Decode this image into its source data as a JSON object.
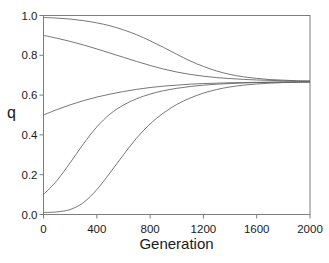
{
  "figure": {
    "background": "#ffffff",
    "frame_color": "#7d7d7d",
    "curve_color": "#5f5f5f",
    "text_color": "#1a1a1a"
  },
  "chart_data": {
    "type": "line",
    "title": "",
    "xlabel": "Generation",
    "ylabel": "q",
    "xlim": [
      0,
      2000
    ],
    "ylim": [
      0.0,
      1.0
    ],
    "x_ticks": [
      0,
      400,
      800,
      1200,
      1600,
      2000
    ],
    "x_tick_labels": [
      "0",
      "400",
      "800",
      "1200",
      "1600",
      "2000"
    ],
    "y_ticks": [
      0.0,
      0.2,
      0.4,
      0.6,
      0.8,
      1.0
    ],
    "y_tick_labels": [
      "0.0",
      "0.2",
      "0.4",
      "0.6",
      "0.8",
      "1.0"
    ],
    "grid": false,
    "legend_position": "none",
    "equilibrium_q": 0.667,
    "x": [
      0,
      100,
      200,
      300,
      400,
      500,
      600,
      700,
      800,
      900,
      1000,
      1100,
      1200,
      1300,
      1400,
      1500,
      1600,
      1700,
      1800,
      1900,
      2000
    ],
    "series": [
      {
        "name": "q0-0.99",
        "initial_q": 0.99,
        "values": [
          0.99,
          0.987,
          0.982,
          0.974,
          0.963,
          0.948,
          0.928,
          0.903,
          0.873,
          0.84,
          0.805,
          0.772,
          0.744,
          0.721,
          0.704,
          0.692,
          0.684,
          0.678,
          0.675,
          0.672,
          0.671
        ]
      },
      {
        "name": "q0-0.9",
        "initial_q": 0.9,
        "values": [
          0.9,
          0.886,
          0.87,
          0.852,
          0.832,
          0.811,
          0.79,
          0.769,
          0.749,
          0.731,
          0.716,
          0.704,
          0.695,
          0.688,
          0.683,
          0.679,
          0.676,
          0.674,
          0.672,
          0.671,
          0.67
        ]
      },
      {
        "name": "q0-0.5",
        "initial_q": 0.5,
        "values": [
          0.5,
          0.527,
          0.551,
          0.572,
          0.59,
          0.605,
          0.618,
          0.629,
          0.638,
          0.645,
          0.65,
          0.655,
          0.658,
          0.66,
          0.662,
          0.663,
          0.664,
          0.665,
          0.666,
          0.666,
          0.667
        ]
      },
      {
        "name": "q0-0.1",
        "initial_q": 0.1,
        "values": [
          0.1,
          0.17,
          0.26,
          0.355,
          0.44,
          0.505,
          0.55,
          0.582,
          0.605,
          0.622,
          0.634,
          0.643,
          0.65,
          0.655,
          0.658,
          0.661,
          0.663,
          0.664,
          0.665,
          0.666,
          0.666
        ]
      },
      {
        "name": "q0-0.01",
        "initial_q": 0.01,
        "values": [
          0.01,
          0.013,
          0.025,
          0.06,
          0.125,
          0.21,
          0.3,
          0.385,
          0.455,
          0.51,
          0.553,
          0.585,
          0.61,
          0.628,
          0.641,
          0.65,
          0.656,
          0.66,
          0.663,
          0.664,
          0.666
        ]
      }
    ]
  }
}
